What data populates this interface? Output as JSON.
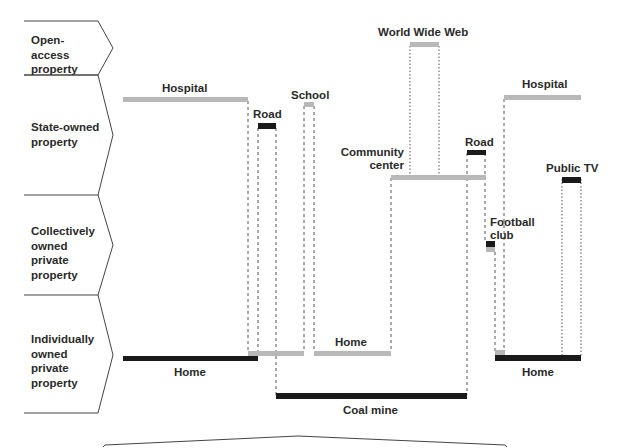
{
  "categories": [
    {
      "id": "open",
      "label": "Open-access property"
    },
    {
      "id": "state",
      "label": "State-owned property"
    },
    {
      "id": "collective",
      "label": "Collectively owned private property"
    },
    {
      "id": "individual",
      "label": "Individually owned private property"
    }
  ],
  "category_lines": {
    "open": [
      "Open-access",
      "property"
    ],
    "state": [
      "State-owned",
      "property"
    ],
    "collective": [
      "Collectively",
      "owned",
      "private",
      "property"
    ],
    "individual": [
      "Individually",
      "owned",
      "private",
      "property"
    ]
  },
  "bars": {
    "hospital_left": "Hospital",
    "home_left": "Home",
    "road_1": "Road",
    "school": "School",
    "home_mid": "Home",
    "coal_mine": "Coal mine",
    "community_center_1": "Community",
    "community_center_2": "center",
    "world_wide_web": "World Wide Web",
    "road_2": "Road",
    "football_1": "Football",
    "football_2": "club",
    "hospital_right": "Hospital",
    "public_tv": "Public TV",
    "home_right": "Home"
  },
  "legend": {
    "dark_bar_color": "#1a1a1a",
    "light_bar_color": "#b8b8b8"
  }
}
